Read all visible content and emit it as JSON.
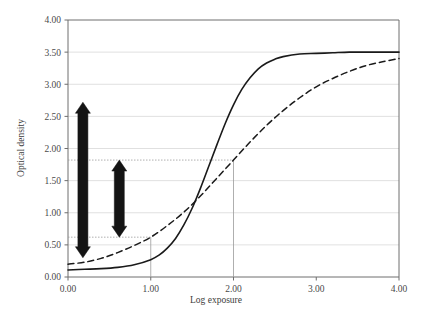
{
  "chart_data": {
    "type": "line",
    "title": "",
    "xlabel": "Log exposure",
    "ylabel": "Optical density",
    "xlim": [
      0.0,
      4.0
    ],
    "ylim": [
      0.0,
      4.0
    ],
    "xticks": [
      "0.00",
      "1.00",
      "2.00",
      "3.00",
      "4.00"
    ],
    "xtick_values": [
      0.0,
      1.0,
      2.0,
      3.0,
      4.0
    ],
    "yticks": [
      "0.00",
      "0.50",
      "1.00",
      "1.50",
      "2.00",
      "2.50",
      "3.00",
      "3.50",
      "4.00"
    ],
    "ytick_values": [
      0.0,
      0.5,
      1.0,
      1.5,
      2.0,
      2.5,
      3.0,
      3.5,
      4.0
    ],
    "grid": true,
    "grid_color": "#d8d8d8",
    "legend": "none",
    "series": [
      {
        "name": "high-contrast-curve",
        "style": "solid",
        "color": "#1a1a1a",
        "x": [
          0.0,
          0.2,
          0.4,
          0.6,
          0.8,
          1.0,
          1.1,
          1.2,
          1.3,
          1.4,
          1.5,
          1.6,
          1.7,
          1.8,
          1.9,
          2.0,
          2.1,
          2.2,
          2.3,
          2.4,
          2.5,
          2.6,
          2.8,
          3.0,
          3.2,
          3.4,
          3.6,
          3.8,
          4.0
        ],
        "y": [
          0.11,
          0.12,
          0.13,
          0.15,
          0.19,
          0.27,
          0.34,
          0.45,
          0.6,
          0.81,
          1.07,
          1.38,
          1.72,
          2.06,
          2.39,
          2.68,
          2.92,
          3.1,
          3.24,
          3.33,
          3.39,
          3.43,
          3.47,
          3.48,
          3.49,
          3.5,
          3.5,
          3.5,
          3.5
        ]
      },
      {
        "name": "low-contrast-curve",
        "style": "dashed",
        "color": "#1a1a1a",
        "x": [
          0.0,
          0.2,
          0.4,
          0.6,
          0.8,
          1.0,
          1.2,
          1.4,
          1.6,
          1.8,
          2.0,
          2.2,
          2.4,
          2.6,
          2.8,
          3.0,
          3.2,
          3.4,
          3.6,
          3.8,
          4.0
        ],
        "y": [
          0.2,
          0.23,
          0.29,
          0.38,
          0.49,
          0.62,
          0.8,
          1.01,
          1.26,
          1.54,
          1.82,
          2.1,
          2.36,
          2.59,
          2.79,
          2.96,
          3.09,
          3.2,
          3.29,
          3.35,
          3.4
        ]
      }
    ],
    "annotations": [
      {
        "name": "density-range-solid",
        "type": "double-arrow",
        "x": 0.18,
        "y_from": 0.3,
        "y_to": 2.72
      },
      {
        "name": "density-range-dashed",
        "type": "double-arrow",
        "x": 0.62,
        "y_from": 0.62,
        "y_to": 1.82
      },
      {
        "name": "guide-low-density",
        "type": "dotted-h-line",
        "y": 0.62,
        "x_from": 0.0,
        "x_to": 1.0
      },
      {
        "name": "guide-high-density",
        "type": "dotted-h-line",
        "y": 1.82,
        "x_from": 0.0,
        "x_to": 2.0
      },
      {
        "name": "guide-low-exposure",
        "type": "v-line",
        "x": 1.0,
        "y_from": 0.0,
        "y_to": 0.62
      },
      {
        "name": "guide-high-exposure",
        "type": "v-line",
        "x": 2.0,
        "y_from": 0.0,
        "y_to": 1.82
      }
    ]
  }
}
